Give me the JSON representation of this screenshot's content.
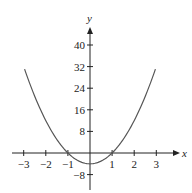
{
  "chart_data": {
    "type": "line",
    "title": "",
    "xlabel": "x",
    "ylabel": "y",
    "function": "y = 4x^2 - 4",
    "x_range": [
      -3,
      3
    ],
    "xlim": [
      -3.4,
      3.9
    ],
    "ylim": [
      -12,
      46
    ],
    "x_ticks": [
      -3,
      -2,
      -1,
      1,
      2,
      3
    ],
    "x_tick_labels": [
      "−3",
      "−2",
      "−1",
      "1",
      "2",
      "3"
    ],
    "y_ticks": [
      -8,
      8,
      16,
      24,
      32,
      40
    ],
    "y_tick_labels": [
      "−8",
      "8",
      "16",
      "24",
      "32",
      "40"
    ],
    "series": [
      {
        "name": "parabola",
        "x": [
          -3,
          -2,
          -1,
          0,
          1,
          2,
          3
        ],
        "y": [
          32,
          12,
          0,
          -4,
          0,
          12,
          32
        ]
      }
    ],
    "curve_color": "#555555",
    "axis_color": "#222222",
    "grid": false,
    "legend": null
  }
}
